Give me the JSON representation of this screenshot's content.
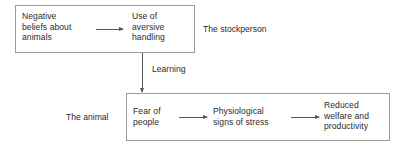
{
  "diagram": {
    "title_present": false,
    "background_color": "#ffffff",
    "line_color": "#9a9a9a",
    "arrow_color": "#555555",
    "text_color": "#2b2b2b",
    "groups": [
      {
        "id": "stockperson",
        "label": "The stockperson",
        "nodes": [
          {
            "id": "negative-beliefs",
            "text": "Negative\nbeliefs about\nanimals"
          },
          {
            "id": "aversive-handling",
            "text": "Use of\naversive\nhandling"
          }
        ]
      },
      {
        "id": "animal",
        "label": "The animal",
        "nodes": [
          {
            "id": "fear-of-people",
            "text": "Fear of\npeople"
          },
          {
            "id": "physiological-signs",
            "text": "Physiological\nsigns of stress"
          },
          {
            "id": "reduced-welfare",
            "text": "Reduced\nwelfare and\nproductivity"
          }
        ]
      }
    ],
    "edges": [
      {
        "id": "beliefs-to-handling",
        "from": "negative-beliefs",
        "to": "aversive-handling",
        "label": "",
        "orientation": "horizontal"
      },
      {
        "id": "handling-to-fear",
        "from": "aversive-handling",
        "to": "fear-of-people",
        "label": "Learning",
        "orientation": "vertical"
      },
      {
        "id": "fear-to-physiological",
        "from": "fear-of-people",
        "to": "physiological-signs",
        "label": "",
        "orientation": "horizontal"
      },
      {
        "id": "physiological-to-welfare",
        "from": "physiological-signs",
        "to": "reduced-welfare",
        "label": "",
        "orientation": "horizontal"
      }
    ]
  }
}
